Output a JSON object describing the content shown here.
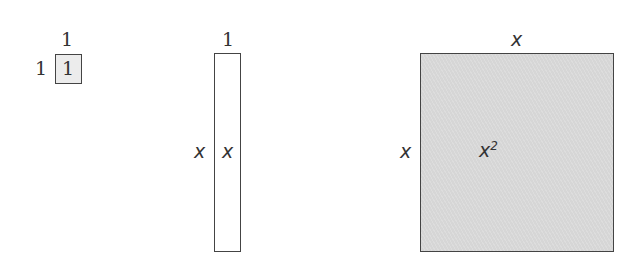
{
  "tiles": {
    "unit": {
      "top_label": "1",
      "side_label": "1",
      "inner_label": "1",
      "fill": "#ececec"
    },
    "bar": {
      "top_label": "1",
      "side_label": "x",
      "inner_label": "x",
      "fill": "#ffffff"
    },
    "square": {
      "top_label": "x",
      "side_label": "x",
      "inner_base": "x",
      "inner_exp": "2",
      "fill": "#d6d6d6"
    }
  }
}
